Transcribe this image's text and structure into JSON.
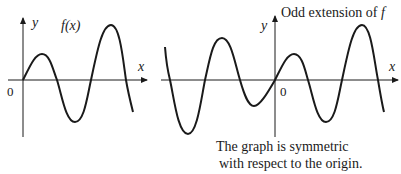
{
  "left_graph": {
    "function_label": "f(x)",
    "y_axis_label": "y",
    "x_axis_label": "x",
    "origin_label": "0"
  },
  "right_graph": {
    "title": "Odd extension of ",
    "title_italic": "f",
    "y_axis_label": "y",
    "x_axis_label": "x",
    "origin_label": "0",
    "caption_line1": "The graph is symmetric",
    "caption_line2": "with respect to the origin."
  },
  "colors": {
    "ink": "#1a1a1a",
    "background": "#ffffff"
  }
}
